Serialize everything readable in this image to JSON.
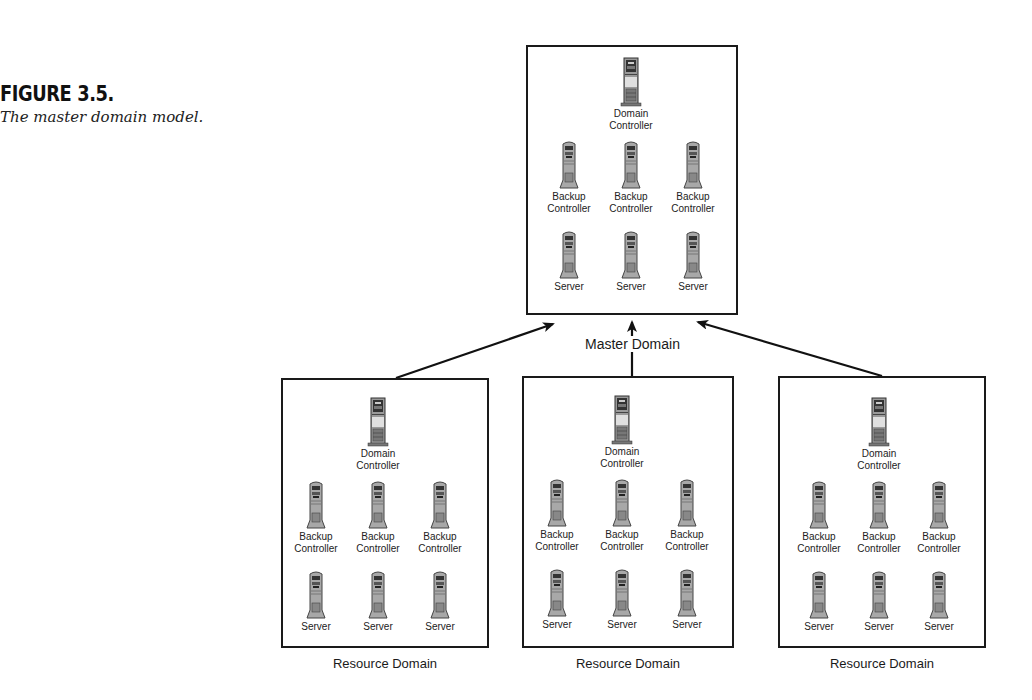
{
  "figure": {
    "number": "FIGURE 3.5.",
    "caption": "The master domain model."
  },
  "master_domain": {
    "label": "Master Domain",
    "domain_controller": "Domain Controller",
    "backup_controllers": [
      "Backup Controller",
      "Backup Controller",
      "Backup Controller"
    ],
    "servers": [
      "Server",
      "Server",
      "Server"
    ]
  },
  "resource_domains": [
    {
      "label": "Resource Domain",
      "domain_controller": "Domain Controller",
      "backup_controllers": [
        "Backup Controller",
        "Backup Controller",
        "Backup Controller"
      ],
      "servers": [
        "Server",
        "Server",
        "Server"
      ]
    },
    {
      "label": "Resource Domain",
      "domain_controller": "Domain Controller",
      "backup_controllers": [
        "Backup Controller",
        "Backup Controller",
        "Backup Controller"
      ],
      "servers": [
        "Server",
        "Server",
        "Server"
      ]
    },
    {
      "label": "Resource Domain",
      "domain_controller": "Domain Controller",
      "backup_controllers": [
        "Backup Controller",
        "Backup Controller",
        "Backup Controller"
      ],
      "servers": [
        "Server",
        "Server",
        "Server"
      ]
    }
  ],
  "relationships": [
    {
      "from": "resource_domains.0",
      "to": "master_domain",
      "type": "trust-arrow"
    },
    {
      "from": "resource_domains.1",
      "to": "master_domain",
      "type": "trust-arrow"
    },
    {
      "from": "resource_domains.2",
      "to": "master_domain",
      "type": "trust-arrow"
    }
  ]
}
